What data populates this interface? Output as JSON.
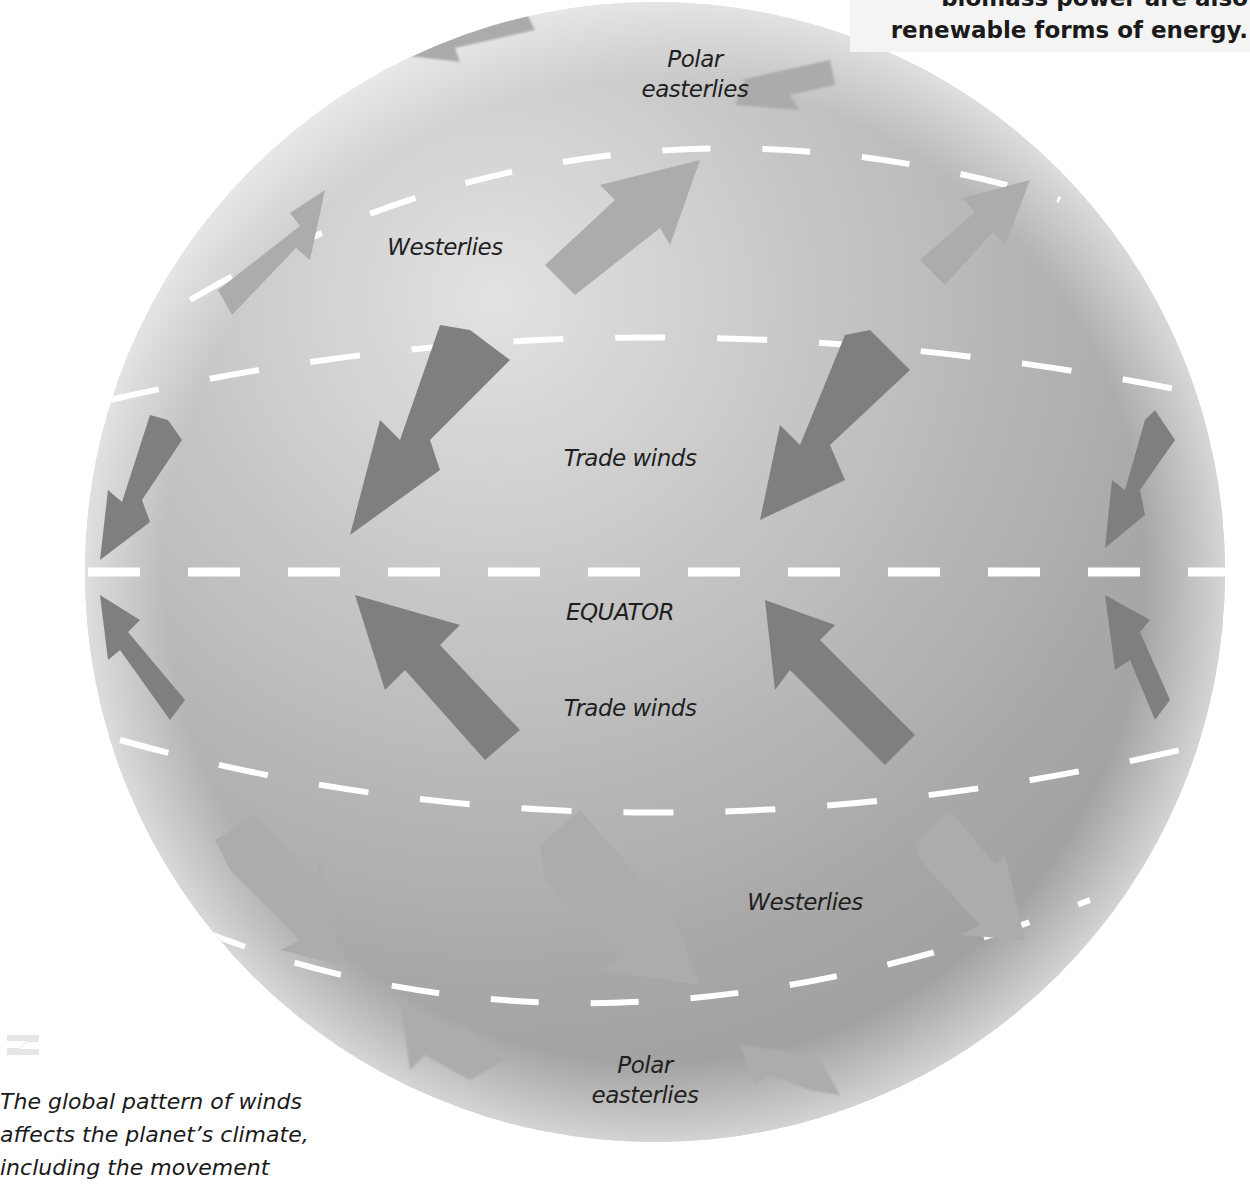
{
  "sidebar_note": {
    "lines": [
      "biomass power are also",
      "renewable forms of energy."
    ]
  },
  "globe": {
    "center_x": 655,
    "center_y": 572,
    "radius": 570,
    "colors": {
      "sphere_light": "#d9d9d9",
      "sphere_mid": "#b3b3b3",
      "sphere_dark": "#8f8f8f",
      "dash": "#ffffff",
      "arrow_light": "#a9a9a9",
      "arrow_dark": "#7e7e7e"
    }
  },
  "labels": {
    "polar_easterlies_north_1": "Polar",
    "polar_easterlies_north_2": "easterlies",
    "westerlies_north": "Westerlies",
    "trade_winds_north": "Trade winds",
    "equator": "EQUATOR",
    "trade_winds_south": "Trade winds",
    "westerlies_south": "Westerlies",
    "polar_easterlies_south_1": "Polar",
    "polar_easterlies_south_2": "easterlies"
  },
  "caption": {
    "lines": [
      "The global pattern of winds",
      " affects the planet’s climate,",
      " including the movement"
    ]
  }
}
